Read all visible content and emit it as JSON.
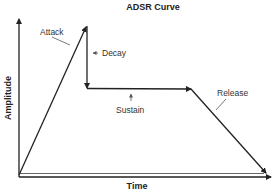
{
  "diagram": {
    "title": "ADSR Curve",
    "x_axis_label": "Time",
    "y_axis_label": "Amplitude",
    "phases": [
      {
        "key": "attack",
        "label": "Attack"
      },
      {
        "key": "decay",
        "label": "Decay"
      },
      {
        "key": "sustain",
        "label": "Sustain"
      },
      {
        "key": "release",
        "label": "Release"
      }
    ],
    "colors": {
      "line": "#222222",
      "text": "#333333",
      "background": "#ffffff"
    }
  }
}
